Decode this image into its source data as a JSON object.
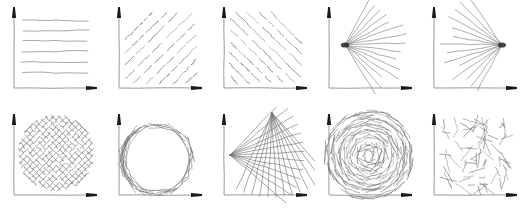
{
  "figure": {
    "background_color": "#ffffff",
    "axis_color": "#9a9a9a",
    "stroke_color": "#6e6e6e",
    "arrow_color": "#1a1a1a",
    "rows": 2,
    "columns": 5
  },
  "panels": [
    {
      "index": 1,
      "position": "row-1-col-1",
      "name": "horizontal-lines",
      "label": "",
      "pattern": "horizontal",
      "line_count": 6,
      "angle_deg": 0
    },
    {
      "index": 2,
      "position": "row-1-col-2",
      "name": "diagonal-lines-up",
      "label": "",
      "pattern": "parallel-diagonal",
      "line_count": 9,
      "angle_deg": 35
    },
    {
      "index": 3,
      "position": "row-1-col-3",
      "name": "diagonal-lines-down",
      "label": "",
      "pattern": "parallel-diagonal",
      "line_count": 12,
      "angle_deg": -35
    },
    {
      "index": 4,
      "position": "row-1-col-4",
      "name": "fan-from-left",
      "label": "",
      "pattern": "radial-fan",
      "line_count": 15,
      "angle_deg": 0
    },
    {
      "index": 5,
      "position": "row-1-col-5",
      "name": "fan-from-right",
      "label": "",
      "pattern": "radial-fan",
      "line_count": 14,
      "angle_deg": 180
    },
    {
      "index": 6,
      "position": "row-2-col-1",
      "name": "crosshatch-grid",
      "label": "",
      "pattern": "crosshatch",
      "line_count": 34,
      "angle_deg": 45
    },
    {
      "index": 7,
      "position": "row-2-col-2",
      "name": "circle-envelope",
      "label": "",
      "pattern": "tangent-arc",
      "line_count": 40,
      "angle_deg": 0
    },
    {
      "index": 8,
      "position": "row-2-col-3",
      "name": "crossed-fans-mesh",
      "label": "",
      "pattern": "dual-fan-mesh",
      "line_count": 26,
      "angle_deg": 0
    },
    {
      "index": 9,
      "position": "row-2-col-4",
      "name": "spiral-swirl",
      "label": "",
      "pattern": "concentric-spiral",
      "line_count": 120,
      "angle_deg": 0
    },
    {
      "index": 10,
      "position": "row-2-col-5",
      "name": "random-scatter",
      "label": "",
      "pattern": "random-short-strokes",
      "line_count": 70,
      "angle_deg": 0
    }
  ]
}
